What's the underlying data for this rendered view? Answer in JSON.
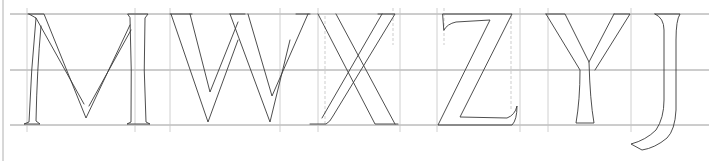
{
  "letters": [
    "M",
    "W",
    "X",
    "Z",
    "Y",
    "J"
  ],
  "colors": {
    "paper": "#ffffff",
    "guide_lines": "#9a9a9a",
    "construction_lines": "#c4c4c4",
    "ink": "#3a3a3a"
  },
  "guides": {
    "cap_line_y": 14,
    "mid_line_y": 70,
    "base_line_y": 125
  }
}
